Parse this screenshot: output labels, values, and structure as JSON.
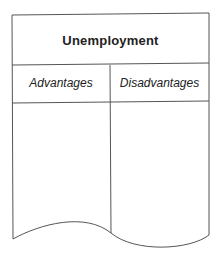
{
  "diagram": {
    "title": "Unemployment",
    "columns": [
      {
        "label": "Advantages"
      },
      {
        "label": "Disadvantages"
      }
    ],
    "line_color": "#555555"
  }
}
